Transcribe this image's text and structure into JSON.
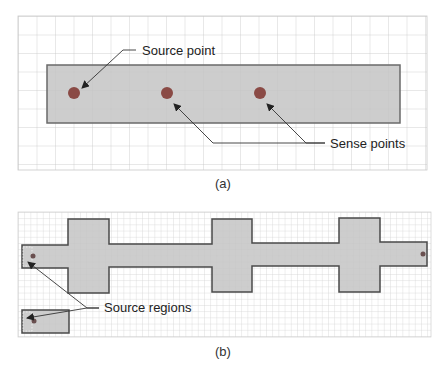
{
  "panel_a": {
    "caption": "(a)",
    "labels": {
      "source": "Source point",
      "sense": "Sense points"
    },
    "colors": {
      "grid": "#c8c8c8",
      "fill": "#c4c4c4",
      "stroke": "#6a6a6a",
      "point": "#8a4a45",
      "arrow": "#333333"
    }
  },
  "panel_b": {
    "caption": "(b)",
    "labels": {
      "source": "Source regions"
    },
    "colors": {
      "grid": "#cfcfcf",
      "fill": "#c4c4c4",
      "stroke": "#4a4a4a",
      "point": "#6a5050"
    }
  }
}
